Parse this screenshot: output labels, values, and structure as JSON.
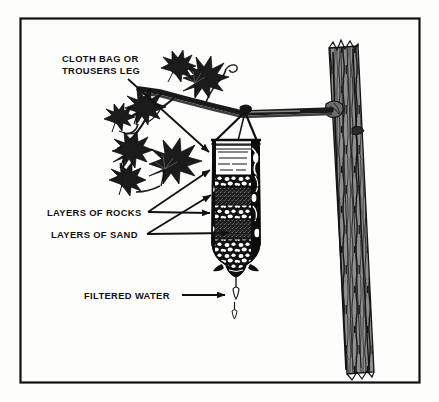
{
  "figure": {
    "border_color": "#111111",
    "background_color": "#fdfdfc",
    "ink_color": "#111111",
    "bark_color": "#8c8c8c",
    "foliage_color": "#1a1a1a"
  },
  "callouts": [
    {
      "id": "cloth-bag",
      "name": "cloth-bag-callout",
      "lines": [
        "CLOTH BAG OR",
        "TROUSERS LEG"
      ],
      "line1": "CLOTH BAG OR",
      "line2": "TROUSERS LEG",
      "text_x": 62,
      "text_y1": 61,
      "text_y2": 73,
      "arrows": [
        {
          "x1": 128,
          "y1": 79,
          "x2": 212,
          "y2": 155
        }
      ]
    },
    {
      "id": "layers-of-rocks",
      "name": "layers-of-rocks-callout",
      "line1": "LAYERS OF ROCKS",
      "text_x": 47,
      "text_y1": 215,
      "arrows": [
        {
          "x1": 148,
          "y1": 212,
          "x2": 214,
          "y2": 167
        },
        {
          "x1": 148,
          "y1": 212,
          "x2": 214,
          "y2": 215
        }
      ]
    },
    {
      "id": "layers-of-sand",
      "name": "layers-of-sand-callout",
      "line1": "LAYERS OF SAND",
      "text_x": 51,
      "text_y1": 237,
      "arrows": [
        {
          "x1": 147,
          "y1": 234,
          "x2": 214,
          "y2": 192
        },
        {
          "x1": 147,
          "y1": 234,
          "x2": 217,
          "y2": 237
        }
      ]
    },
    {
      "id": "filtered-water",
      "name": "filtered-water-callout",
      "line1": "FILTERED WATER",
      "text_x": 84,
      "text_y1": 299,
      "arrows": [
        {
          "x1": 182,
          "y1": 295,
          "x2": 224,
          "y2": 295
        }
      ]
    }
  ],
  "filter_layers": [
    {
      "name": "clear-filtered-water-reservoir",
      "label": "water",
      "order": 1
    },
    {
      "name": "rock-layer-upper",
      "label": "rocks",
      "order": 2
    },
    {
      "name": "sand-layer-upper",
      "label": "sand",
      "order": 3
    },
    {
      "name": "rock-layer-lower",
      "label": "rocks",
      "order": 4
    },
    {
      "name": "sand-layer-lower",
      "label": "sand",
      "order": 5
    },
    {
      "name": "rock-layer-bottom",
      "label": "rocks",
      "order": 6
    }
  ],
  "scene_elements": [
    {
      "name": "tree-trunk"
    },
    {
      "name": "tree-branch"
    },
    {
      "name": "foliage-leaves"
    },
    {
      "name": "hanging-cords"
    },
    {
      "name": "filter-bag"
    },
    {
      "name": "water-drip"
    }
  ]
}
